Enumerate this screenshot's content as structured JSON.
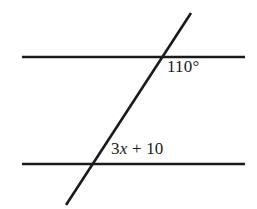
{
  "figure": {
    "background_color": "#ffffff",
    "stroke_color": "#1a1a1a",
    "text_color": "#1a1a1a",
    "width": 257,
    "height": 209
  },
  "labels": {
    "upper_angle": "110°",
    "lower_angle_prefix": "3",
    "lower_angle_variable": "x",
    "lower_angle_suffix": " + 10",
    "lower_angle_full": "3x + 10"
  },
  "geometry": {
    "line_width": 2.6,
    "top_parallel_line": {
      "name": "top-parallel-line",
      "x1": 22,
      "y1": 57,
      "x2": 245,
      "y2": 57
    },
    "bottom_parallel_line": {
      "name": "bottom-parallel-line",
      "x1": 22,
      "y1": 164,
      "x2": 245,
      "y2": 164
    },
    "transversal_line": {
      "name": "transversal-line",
      "x1": 191,
      "y1": 13,
      "x2": 66,
      "y2": 205
    },
    "upper_intersection": {
      "x": 165,
      "y": 57
    },
    "lower_intersection": {
      "x": 95,
      "y": 164
    }
  }
}
